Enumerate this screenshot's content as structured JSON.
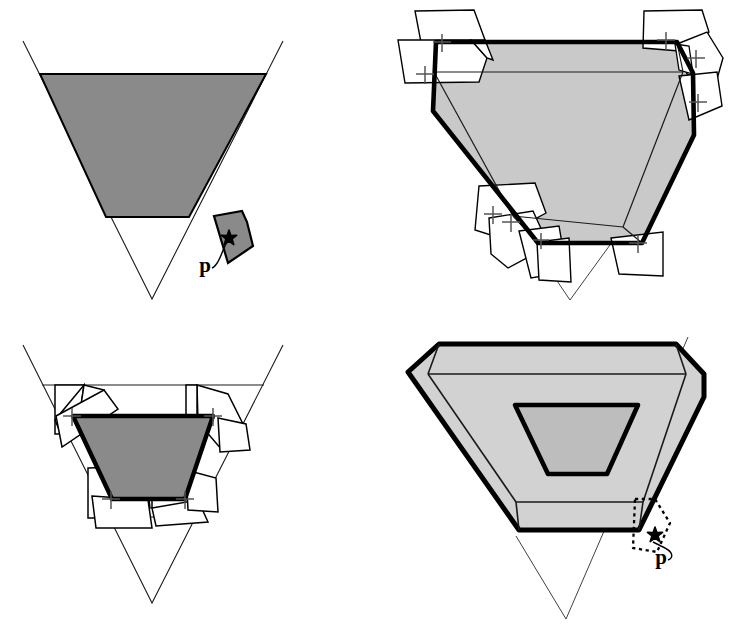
{
  "figure": {
    "background_color": "#ffffff",
    "width": 742,
    "height": 625,
    "panel_count": 4,
    "layout": "2x2 grid"
  },
  "colors": {
    "stroke": "#000000",
    "thin_stroke": "#1a1a1a",
    "fill_dark_gray": "#8a8a8a",
    "fill_mid_gray": "#c9c9c9",
    "fill_light_gray": "#d2d2d2",
    "fill_inner_gray": "#bdbdbd",
    "fill_white": "#ffffff",
    "marker_black": "#000000"
  },
  "panels": [
    {
      "id": "panel-top-left",
      "name": "initial-cone-with-patch",
      "position": "top-left",
      "labels": [
        {
          "id": "p-label-tl",
          "text": "p",
          "x": 205,
          "y": 272
        }
      ],
      "shapes": {
        "cone_outline": "inverted triangle",
        "shaded_band": "trapezoid band filled dark gray",
        "detached_patch": "small quadrilateral with point marker"
      }
    },
    {
      "id": "panel-top-right",
      "name": "cone-with-unfolded-flaps",
      "position": "top-right",
      "labels": [],
      "shapes": {
        "body": "light gray trapezoid with thick black border",
        "flaps": "white quadrilateral flaps folded outward at corners",
        "markers": "plus-shaped corner markers"
      }
    },
    {
      "id": "panel-bottom-left",
      "name": "contracted-cone-with-flaps",
      "position": "bottom-left",
      "labels": [],
      "shapes": {
        "cone_outline": "inverted triangle",
        "core": "dark gray trapezoid with thick black border",
        "flaps": "white quadrilateral flaps",
        "markers": "plus-shaped corner markers"
      }
    },
    {
      "id": "panel-bottom-right",
      "name": "offset-shell-with-patch",
      "position": "bottom-right",
      "labels": [
        {
          "id": "p-label-br",
          "text": "p",
          "x": 290,
          "y": 252
        }
      ],
      "shapes": {
        "outer_shell": "rounded trapezoid light gray, thick border",
        "mid_band": "light gray band",
        "inner_core": "gray trapezoid with thick border",
        "dashed_patch": "dotted quadrilateral with point marker"
      }
    }
  ],
  "annotations": {
    "point_label": "p",
    "point_label_occurrences": 2,
    "marker_glyph": "star-burst point marker"
  }
}
